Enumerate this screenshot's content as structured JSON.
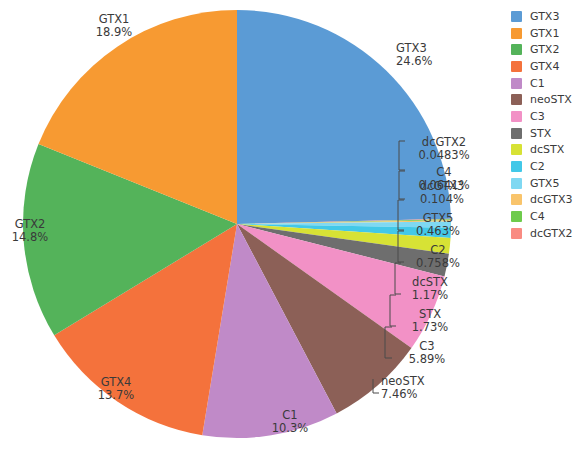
{
  "chart_data": {
    "type": "pie",
    "title": "",
    "subtitle": "",
    "xlabel": "",
    "ylabel": "",
    "legend_position": "right",
    "grid": false,
    "start_angle_deg": 90,
    "direction": "clockwise",
    "categories": [
      "GTX3",
      "dcGTX2",
      "C4",
      "dcGTX3",
      "GTX5",
      "C2",
      "dcSTX",
      "STX",
      "C3",
      "neoSTX",
      "C1",
      "GTX4",
      "GTX2",
      "GTX1"
    ],
    "values": [
      24.6,
      0.0483,
      0.0641,
      0.104,
      0.463,
      0.758,
      1.17,
      1.73,
      5.89,
      7.46,
      10.3,
      13.7,
      14.8,
      18.9
    ],
    "value_labels": [
      "24.6%",
      "0.0483%",
      "0.0641%",
      "0.104%",
      "0.463%",
      "0.758%",
      "1.17%",
      "1.73%",
      "5.89%",
      "7.46%",
      "10.3%",
      "13.7%",
      "14.8%",
      "18.9%"
    ],
    "slices": [
      {
        "name": "GTX3",
        "percent": 24.6,
        "label": "GTX3",
        "value_text": "24.6%",
        "color": "#5b9bd5"
      },
      {
        "name": "dcGTX2",
        "percent": 0.0483,
        "label": "dcGTX2",
        "value_text": "0.0483%",
        "color": "#f98b82"
      },
      {
        "name": "C4",
        "percent": 0.0641,
        "label": "C4",
        "value_text": "0.0641%",
        "color": "#6ecb4c"
      },
      {
        "name": "dcGTX3",
        "percent": 0.104,
        "label": "dcGTX3",
        "value_text": "0.104%",
        "color": "#f9c46b"
      },
      {
        "name": "GTX5",
        "percent": 0.463,
        "label": "GTX5",
        "value_text": "0.463%",
        "color": "#7fd8f2"
      },
      {
        "name": "C2",
        "percent": 0.758,
        "label": "C2",
        "value_text": "0.758%",
        "color": "#42c8e8"
      },
      {
        "name": "dcSTX",
        "percent": 1.17,
        "label": "dcSTX",
        "value_text": "1.17%",
        "color": "#d7e235"
      },
      {
        "name": "STX",
        "percent": 1.73,
        "label": "STX",
        "value_text": "1.73%",
        "color": "#6e6e6e"
      },
      {
        "name": "C3",
        "percent": 5.89,
        "label": "C3",
        "value_text": "5.89%",
        "color": "#f291c6"
      },
      {
        "name": "neoSTX",
        "percent": 7.46,
        "label": "neoSTX",
        "value_text": "7.46%",
        "color": "#8c6057"
      },
      {
        "name": "C1",
        "percent": 10.3,
        "label": "C1",
        "value_text": "10.3%",
        "color": "#c08ac8"
      },
      {
        "name": "GTX4",
        "percent": 13.7,
        "label": "GTX4",
        "value_text": "13.7%",
        "color": "#f4723c"
      },
      {
        "name": "GTX2",
        "percent": 14.8,
        "label": "GTX2",
        "value_text": "14.8%",
        "color": "#54b35a"
      },
      {
        "name": "GTX1",
        "percent": 18.9,
        "label": "GTX1",
        "value_text": "18.9%",
        "color": "#f79a32"
      }
    ]
  },
  "legend": {
    "items": [
      {
        "label": "GTX3",
        "color": "#5b9bd5"
      },
      {
        "label": "GTX1",
        "color": "#f79a32"
      },
      {
        "label": "GTX2",
        "color": "#54b35a"
      },
      {
        "label": "GTX4",
        "color": "#f4723c"
      },
      {
        "label": "C1",
        "color": "#c08ac8"
      },
      {
        "label": "neoSTX",
        "color": "#8c6057"
      },
      {
        "label": "C3",
        "color": "#f291c6"
      },
      {
        "label": "STX",
        "color": "#6e6e6e"
      },
      {
        "label": "dcSTX",
        "color": "#d7e235"
      },
      {
        "label": "C2",
        "color": "#42c8e8"
      },
      {
        "label": "GTX5",
        "color": "#7fd8f2"
      },
      {
        "label": "dcGTX3",
        "color": "#f9c46b"
      },
      {
        "label": "C4",
        "color": "#6ecb4c"
      },
      {
        "label": "dcGTX2",
        "color": "#f98b82"
      }
    ]
  },
  "annotations": {
    "outer_labels": [
      {
        "name": "GTX3",
        "label": "GTX3",
        "value_text": "24.6%",
        "x": 396,
        "y": 52,
        "anchor": "start"
      },
      {
        "name": "GTX1",
        "label": "GTX1",
        "value_text": "18.9%",
        "x": 114,
        "y": 23,
        "anchor": "middle"
      },
      {
        "name": "GTX2",
        "label": "GTX2",
        "value_text": "14.8%",
        "x": 30,
        "y": 228,
        "anchor": "middle"
      },
      {
        "name": "GTX4",
        "label": "GTX4",
        "value_text": "13.7%",
        "x": 116,
        "y": 386,
        "anchor": "middle"
      },
      {
        "name": "C1",
        "label": "C1",
        "value_text": "10.3%",
        "x": 290,
        "y": 419,
        "anchor": "middle"
      },
      {
        "name": "neoSTX",
        "label": "neoSTX",
        "value_text": "7.46%",
        "x": 381,
        "y": 385,
        "anchor": "start"
      },
      {
        "name": "C3",
        "label": "C3",
        "value_text": "5.89%",
        "x": 427,
        "y": 350,
        "anchor": "middle"
      },
      {
        "name": "STX",
        "label": "STX",
        "value_text": "1.73%",
        "x": 430,
        "y": 318,
        "anchor": "middle"
      },
      {
        "name": "dcSTX",
        "label": "dcSTX",
        "value_text": "1.17%",
        "x": 430,
        "y": 286,
        "anchor": "middle"
      },
      {
        "name": "C2",
        "label": "C2",
        "value_text": "0.758%",
        "x": 438,
        "y": 254,
        "anchor": "middle"
      },
      {
        "name": "GTX5",
        "label": "GTX5",
        "value_text": "0.463%",
        "x": 438,
        "y": 222,
        "anchor": "middle"
      },
      {
        "name": "dcGTX3",
        "label": "dcGTX3",
        "value_text": "0.104%",
        "x": 442,
        "y": 190,
        "anchor": "middle"
      },
      {
        "name": "C4",
        "label": "C4",
        "value_text": "0.0641%",
        "x": 444,
        "y": 176,
        "anchor": "middle"
      },
      {
        "name": "dcGTX2",
        "label": "dcGTX2",
        "value_text": "0.0483%",
        "x": 444,
        "y": 146,
        "anchor": "middle"
      }
    ]
  },
  "geometry": {
    "center_x": 237,
    "center_y": 224,
    "radius": 214
  }
}
